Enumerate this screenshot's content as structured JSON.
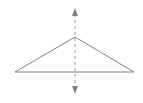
{
  "figure": {
    "title": "",
    "caption": "",
    "width": 143,
    "height": 103,
    "background_color": "#ffffff",
    "line_color": "#808080",
    "axis_color": "#999999",
    "stroke_width": 1
  },
  "chart_data": {
    "type": "diagram",
    "subtype": "geometry-line-figure",
    "title": "",
    "xlabel": "",
    "ylabel": "",
    "grid": false,
    "legend": null,
    "shapes": [
      {
        "name": "triangle",
        "kind": "polygon",
        "closed": true,
        "points": [
          [
            15,
            72
          ],
          [
            75,
            37
          ],
          [
            134,
            72
          ]
        ],
        "stroke": "#808080",
        "stroke_width": 1,
        "fill": "none",
        "dashed": false
      },
      {
        "name": "axis-of-symmetry",
        "kind": "line",
        "from": [
          75,
          9
        ],
        "to": [
          75,
          93
        ],
        "stroke": "#999999",
        "stroke_width": 1,
        "dashed": true,
        "dash_pattern": "3 3",
        "arrow_start": true,
        "arrow_end": true
      }
    ],
    "vertices": [
      {
        "name": "apex",
        "x": 75,
        "y": 37
      },
      {
        "name": "base-left",
        "x": 15,
        "y": 72
      },
      {
        "name": "base-right",
        "x": 134,
        "y": 72
      }
    ],
    "annotations": []
  }
}
